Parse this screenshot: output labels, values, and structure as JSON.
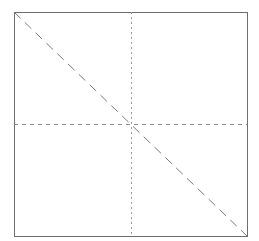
{
  "diagram": {
    "width": 259,
    "height": 241,
    "background": "#ffffff",
    "frame": {
      "x1": 14,
      "y1": 12,
      "x2": 247,
      "y2": 236,
      "color": "#6e6e6e",
      "stroke_width": 1
    },
    "diagonal": {
      "x1": 14,
      "y1": 12,
      "x2": 247,
      "y2": 236,
      "color": "#7a7a7a",
      "dash": "9,6",
      "stroke_width": 1
    },
    "vertical_center": {
      "x": 131,
      "y1": 12,
      "y2": 236,
      "color": "#9a9a9a",
      "dash": "2,3",
      "stroke_width": 1
    },
    "horizontal_center": {
      "y": 124,
      "x1": 14,
      "x2": 247,
      "color": "#8a8a8a",
      "dash": "4,4",
      "stroke_width": 1
    }
  }
}
